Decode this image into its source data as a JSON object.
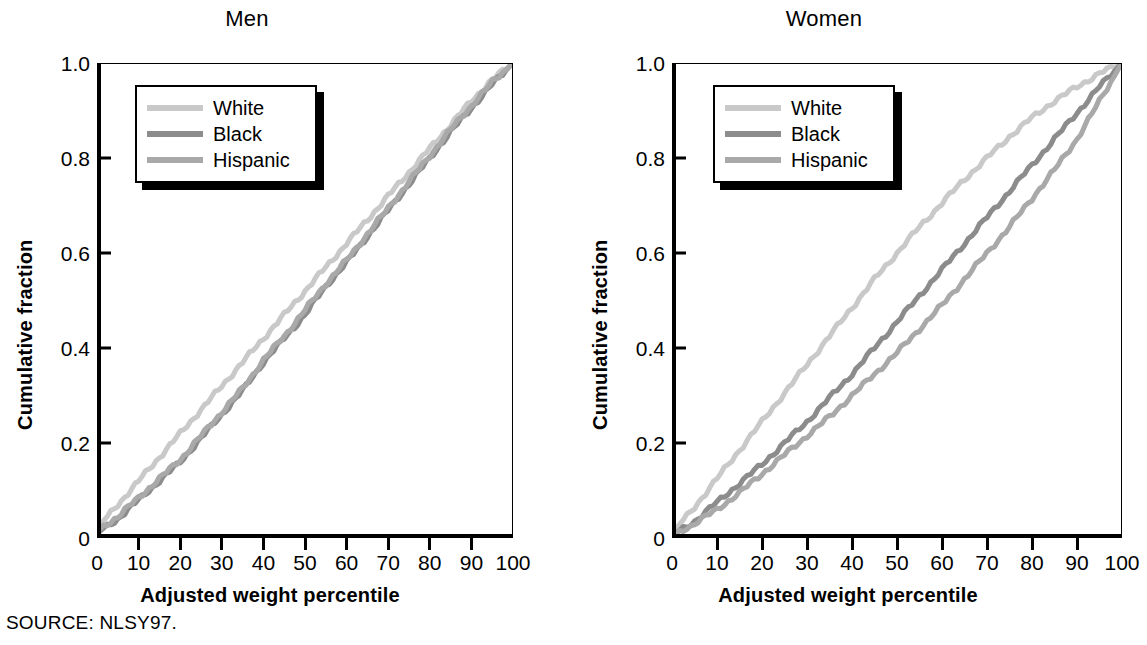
{
  "source_note": "SOURCE: NLSY97.",
  "colors": {
    "white_series": "#c9c9c9",
    "black_series": "#8c8c8c",
    "hispanic_series": "#a9a9a9",
    "axis": "#000000",
    "background": "#ffffff"
  },
  "panels": [
    {
      "id": "men",
      "title": "Men",
      "xlabel": "Adjusted weight percentile",
      "ylabel": "Cumulative fraction",
      "xticks": [
        "0",
        "10",
        "20",
        "30",
        "40",
        "50",
        "60",
        "70",
        "80",
        "90",
        "100"
      ],
      "yticks": [
        "0",
        "0.2",
        "0.4",
        "0.6",
        "0.8",
        "1.0"
      ],
      "legend": [
        "White",
        "Black",
        "Hispanic"
      ]
    },
    {
      "id": "women",
      "title": "Women",
      "xlabel": "Adjusted weight percentile",
      "ylabel": "Cumulative fraction",
      "xticks": [
        "0",
        "10",
        "20",
        "30",
        "40",
        "50",
        "60",
        "70",
        "80",
        "90",
        "100"
      ],
      "yticks": [
        "0",
        "0.2",
        "0.4",
        "0.6",
        "0.8",
        "1.0"
      ],
      "legend": [
        "White",
        "Black",
        "Hispanic"
      ]
    }
  ],
  "chart_data": [
    {
      "type": "line",
      "title": "Men",
      "xlabel": "Adjusted weight percentile",
      "ylabel": "Cumulative fraction",
      "xlim": [
        0,
        100
      ],
      "ylim": [
        0,
        1.0
      ],
      "xticks": [
        0,
        10,
        20,
        30,
        40,
        50,
        60,
        70,
        80,
        90,
        100
      ],
      "yticks": [
        0,
        0.2,
        0.4,
        0.6,
        0.8,
        1.0
      ],
      "grid": false,
      "legend_position": "upper-left",
      "x": [
        0,
        5,
        10,
        15,
        20,
        25,
        30,
        35,
        40,
        45,
        50,
        55,
        60,
        65,
        70,
        75,
        80,
        85,
        90,
        95,
        100
      ],
      "series": [
        {
          "name": "White",
          "color": "#c9c9c9",
          "values": [
            0.02,
            0.07,
            0.12,
            0.17,
            0.22,
            0.27,
            0.32,
            0.37,
            0.42,
            0.47,
            0.52,
            0.57,
            0.62,
            0.67,
            0.72,
            0.77,
            0.82,
            0.87,
            0.92,
            0.965,
            1.0
          ]
        },
        {
          "name": "Black",
          "color": "#8c8c8c",
          "values": [
            0.01,
            0.04,
            0.08,
            0.12,
            0.16,
            0.21,
            0.26,
            0.31,
            0.37,
            0.42,
            0.47,
            0.53,
            0.58,
            0.635,
            0.69,
            0.745,
            0.8,
            0.855,
            0.905,
            0.955,
            1.0
          ]
        },
        {
          "name": "Hispanic",
          "color": "#a9a9a9",
          "values": [
            0.015,
            0.045,
            0.085,
            0.125,
            0.165,
            0.215,
            0.265,
            0.315,
            0.375,
            0.425,
            0.48,
            0.535,
            0.585,
            0.64,
            0.695,
            0.75,
            0.805,
            0.86,
            0.91,
            0.96,
            1.0
          ]
        }
      ]
    },
    {
      "type": "line",
      "title": "Women",
      "xlabel": "Adjusted weight percentile",
      "ylabel": "Cumulative fraction",
      "xlim": [
        0,
        100
      ],
      "ylim": [
        0,
        1.0
      ],
      "xticks": [
        0,
        10,
        20,
        30,
        40,
        50,
        60,
        70,
        80,
        90,
        100
      ],
      "yticks": [
        0,
        0.2,
        0.4,
        0.6,
        0.8,
        1.0
      ],
      "grid": false,
      "legend_position": "upper-left",
      "x": [
        0,
        5,
        10,
        15,
        20,
        25,
        30,
        35,
        40,
        45,
        50,
        55,
        60,
        65,
        70,
        75,
        80,
        85,
        90,
        95,
        100
      ],
      "series": [
        {
          "name": "White",
          "color": "#c9c9c9",
          "values": [
            0.01,
            0.065,
            0.125,
            0.185,
            0.245,
            0.305,
            0.365,
            0.425,
            0.485,
            0.545,
            0.6,
            0.655,
            0.705,
            0.755,
            0.8,
            0.845,
            0.885,
            0.92,
            0.95,
            0.978,
            1.0
          ]
        },
        {
          "name": "Black",
          "color": "#8c8c8c",
          "values": [
            0.005,
            0.035,
            0.075,
            0.115,
            0.155,
            0.2,
            0.245,
            0.295,
            0.345,
            0.4,
            0.455,
            0.51,
            0.565,
            0.62,
            0.675,
            0.73,
            0.785,
            0.84,
            0.895,
            0.95,
            1.0
          ]
        },
        {
          "name": "Hispanic",
          "color": "#a9a9a9",
          "values": [
            0.005,
            0.03,
            0.06,
            0.095,
            0.135,
            0.175,
            0.215,
            0.255,
            0.3,
            0.345,
            0.39,
            0.44,
            0.49,
            0.545,
            0.6,
            0.655,
            0.715,
            0.775,
            0.84,
            0.92,
            1.0
          ]
        }
      ]
    }
  ]
}
